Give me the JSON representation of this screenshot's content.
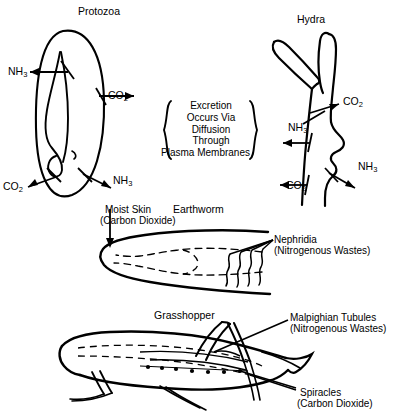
{
  "figure": {
    "topic": "Excretion in simple organisms",
    "background_color": "#ffffff",
    "ink_color": "#000000"
  },
  "center_note": {
    "name": "excretion-caption",
    "lines": [
      "Excretion",
      "Occurs Via",
      "Diffusion",
      "Through",
      "Plasma Membranes"
    ],
    "left_brace": "{",
    "right_brace": "}"
  },
  "organisms": [
    {
      "id": "protozoa",
      "title": "Protozoa",
      "labels": [
        {
          "id": "protozoa-nh3-upper",
          "text": "NH",
          "sub": "3"
        },
        {
          "id": "protozoa-co2-right",
          "text": "CO",
          "sub": "2"
        },
        {
          "id": "protozoa-co2-lower",
          "text": "CO",
          "sub": "2"
        },
        {
          "id": "protozoa-nh3-lower",
          "text": "NH",
          "sub": "3"
        }
      ]
    },
    {
      "id": "hydra",
      "title": "Hydra",
      "labels": [
        {
          "id": "hydra-co2-upper",
          "text": "CO",
          "sub": "2"
        },
        {
          "id": "hydra-nh3-left",
          "text": "NH",
          "sub": "3"
        },
        {
          "id": "hydra-nh3-right",
          "text": "NH",
          "sub": "3"
        },
        {
          "id": "hydra-co2-lower",
          "text": "CO",
          "sub": "2"
        }
      ]
    },
    {
      "id": "earthworm",
      "title": "Earthworm",
      "callouts": [
        {
          "id": "moist-skin",
          "line1": "Moist Skin",
          "line2": "(Carbon Dioxide)"
        },
        {
          "id": "nephridia",
          "line1": "Nephridia",
          "line2": "(Nitrogenous Wastes)"
        }
      ]
    },
    {
      "id": "grasshopper",
      "title": "Grasshopper",
      "callouts": [
        {
          "id": "malpighian-tubules",
          "line1": "Malpighian Tubules",
          "line2": "(Nitrogenous Wastes)"
        },
        {
          "id": "spiracles",
          "line1": "Spiracles",
          "line2": "(Carbon Dioxide)"
        }
      ]
    }
  ]
}
